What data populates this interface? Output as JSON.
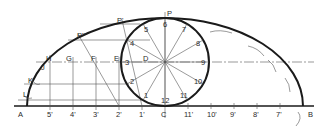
{
  "diagram": {
    "point_labels": {
      "A": "A",
      "B": "B",
      "C": "C",
      "D": "D",
      "E": "E",
      "F": "F",
      "G": "G",
      "H": "H",
      "J": "J",
      "K": "K",
      "L": "L",
      "P": "P",
      "P1": "P'",
      "P2": "P''"
    },
    "circle_labels": [
      "1",
      "2",
      "3",
      "4",
      "5",
      "6",
      "7",
      "8",
      "9",
      "10",
      "11",
      "12"
    ],
    "baseline_labels_left": [
      "5'",
      "4'",
      "3'",
      "2'",
      "1'"
    ],
    "baseline_labels_right": [
      "11'",
      "10'",
      "9'",
      "8'",
      "7'"
    ],
    "colors": {
      "ink": "#1a1a1a",
      "construction": "#555555",
      "background": "#ffffff"
    }
  }
}
